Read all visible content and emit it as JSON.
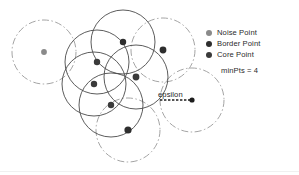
{
  "figure": {
    "background_color": "#ffffff",
    "width": 299,
    "height": 175
  },
  "legend": {
    "position": "top-right",
    "items": [
      {
        "label": "Noise Point",
        "color": "#8a8a8a",
        "icon": "filled-circle-icon"
      },
      {
        "label": "Border Point",
        "color": "#2e2e2e",
        "icon": "filled-circle-icon"
      },
      {
        "label": "Core Point",
        "color": "#3a3a3a",
        "icon": "filled-circle-icon"
      }
    ]
  },
  "parameters": {
    "minpts_text": "minPts = 4"
  },
  "annotations": {
    "epsilon_label": "epsilon",
    "epsilon_arrow": {
      "x1": 160,
      "y1": 100,
      "x2": 192,
      "y2": 100,
      "style": "dashed"
    },
    "epsilon_endpoint": {
      "cx": 192,
      "cy": 100,
      "r": 2.6
    }
  },
  "chart_data": {
    "type": "scatter",
    "xlabel": "",
    "ylabel": "",
    "grid": false,
    "legend_position": "top-right",
    "colors": {
      "noise": "#8a8a8a",
      "border": "#2e2e2e",
      "core": "#3a3a3a",
      "solid_circle_stroke": "#4a4a4a",
      "dashdot_circle_stroke": "#9a9a9a"
    },
    "epsilon_radius_px": 32,
    "points": [
      {
        "id": "p1",
        "cx": 44,
        "cy": 52,
        "r": 2.9,
        "type": "noise"
      },
      {
        "id": "p2",
        "cx": 123,
        "cy": 42,
        "r": 3.2,
        "type": "border"
      },
      {
        "id": "p3",
        "cx": 163,
        "cy": 50,
        "r": 3.4,
        "type": "border"
      },
      {
        "id": "p4",
        "cx": 97,
        "cy": 62,
        "r": 3.2,
        "type": "core"
      },
      {
        "id": "p5",
        "cx": 136,
        "cy": 77,
        "r": 3.4,
        "type": "core"
      },
      {
        "id": "p6",
        "cx": 94,
        "cy": 84,
        "r": 3.2,
        "type": "core"
      },
      {
        "id": "p7",
        "cx": 111,
        "cy": 105,
        "r": 3.2,
        "type": "core"
      },
      {
        "id": "p8",
        "cx": 128,
        "cy": 130,
        "r": 3.6,
        "type": "border"
      }
    ],
    "solid_circles": [
      {
        "cx": 97,
        "cy": 62,
        "r": 32
      },
      {
        "cx": 136,
        "cy": 77,
        "r": 32
      },
      {
        "cx": 94,
        "cy": 84,
        "r": 32
      },
      {
        "cx": 111,
        "cy": 105,
        "r": 32
      },
      {
        "cx": 123,
        "cy": 42,
        "r": 32
      }
    ],
    "dashdot_circles": [
      {
        "cx": 44,
        "cy": 52,
        "r": 32
      },
      {
        "cx": 163,
        "cy": 50,
        "r": 32
      },
      {
        "cx": 128,
        "cy": 130,
        "r": 32
      },
      {
        "cx": 192,
        "cy": 100,
        "r": 32
      }
    ]
  }
}
